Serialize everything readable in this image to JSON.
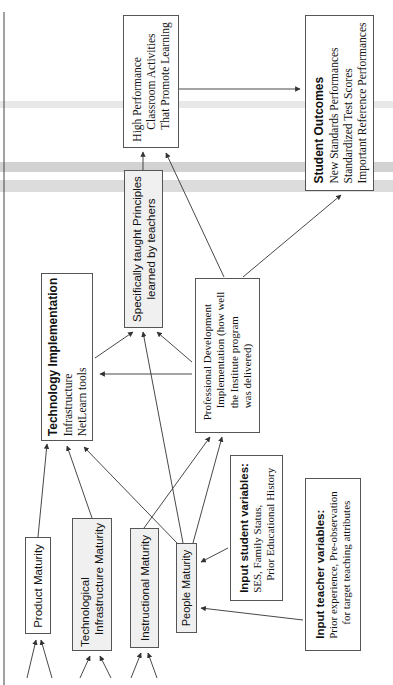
{
  "diagram": {
    "colors": {
      "line": "#333333",
      "box_border": "#555555",
      "shaded_fill": "#f0f0f0",
      "scan_band_light": "#e6e6e6",
      "scan_band_dark": "#cfcfcf"
    },
    "nodes": {
      "high_performance": {
        "lines": [
          "High Performance",
          "Classroom Activities",
          "That Promote Learning"
        ]
      },
      "student_outcomes": {
        "title": "Student Outcomes",
        "lines": [
          "New Standards Performances",
          "Standardized Test Scores",
          "Important Reference Performances"
        ]
      },
      "specifically_taught": {
        "lines": [
          "Specifically taught Principles",
          "learned by teachers"
        ]
      },
      "technology_implementation": {
        "title": "Technology Implementation",
        "lines": [
          "Infrastructure",
          "NetLearn tools"
        ]
      },
      "professional_development": {
        "lines": [
          "Professional Development",
          "Implementation (how well",
          "the Institute program",
          "was delivered)"
        ]
      },
      "input_student": {
        "title": "Input student variables:",
        "lines": [
          "SES, Family Status,",
          "Prior Educational History"
        ]
      },
      "input_teacher": {
        "title": "Input teacher variables:",
        "lines": [
          "Prior experience, Pre-observation",
          "for target teaching attributes"
        ]
      },
      "product_maturity": {
        "label": "Product Maturity"
      },
      "tech_infrastructure_maturity": {
        "lines": [
          "Technological",
          "Infrastructure Maturity"
        ]
      },
      "instructional_maturity": {
        "label": "Instructional Maturity"
      },
      "people_maturity": {
        "label": "People Maturity"
      }
    }
  }
}
